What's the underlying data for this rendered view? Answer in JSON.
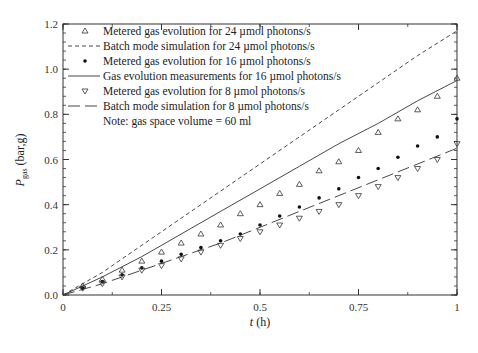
{
  "chart_data": {
    "type": "line",
    "title": "",
    "xlabel": "t (h)",
    "ylabel": "P_gas (bar,g)",
    "xlabel_parts": {
      "var": "t",
      "unit": " (h)"
    },
    "ylabel_parts": {
      "var": "P",
      "sub": "gas",
      "unit": " (bar,g)"
    },
    "xlim": [
      0,
      1
    ],
    "ylim": [
      0,
      1.2
    ],
    "x_ticks": [
      0,
      0.25,
      0.5,
      0.75,
      1
    ],
    "x_tick_labels": [
      "0",
      "0.25",
      "0.5",
      "0.75",
      "1"
    ],
    "y_ticks": [
      0.0,
      0.2,
      0.4,
      0.6,
      0.8,
      1.0,
      1.2
    ],
    "y_tick_labels": [
      "0.0",
      "0.2",
      "0.4",
      "0.6",
      "0.8",
      "1.0",
      "1.2"
    ],
    "grid": false,
    "legend_position": "upper left inside",
    "annotation": "Note: gas space volume = 60 ml",
    "series": [
      {
        "name": "Metered gas evolution for 24 µmol photons/s",
        "style": "marker-triangle-up",
        "x": [
          0.05,
          0.1,
          0.15,
          0.2,
          0.25,
          0.3,
          0.35,
          0.4,
          0.45,
          0.5,
          0.55,
          0.6,
          0.65,
          0.7,
          0.75,
          0.8,
          0.85,
          0.9,
          0.95,
          1.0
        ],
        "values": [
          0.04,
          0.07,
          0.11,
          0.15,
          0.19,
          0.23,
          0.27,
          0.31,
          0.36,
          0.4,
          0.45,
          0.49,
          0.55,
          0.59,
          0.64,
          0.72,
          0.78,
          0.82,
          0.88,
          0.96
        ]
      },
      {
        "name": "Batch mode simulation for 24 µmol photons/s",
        "style": "short-dash",
        "x": [
          0,
          0.1,
          0.2,
          0.3,
          0.4,
          0.5,
          0.6,
          0.7,
          0.8,
          0.9,
          1.0
        ],
        "values": [
          0,
          0.1,
          0.22,
          0.34,
          0.46,
          0.58,
          0.7,
          0.82,
          0.94,
          1.06,
          1.17
        ]
      },
      {
        "name": "Metered gas evolution for 16 µmol photons/s",
        "style": "marker-dot",
        "x": [
          0.05,
          0.1,
          0.15,
          0.2,
          0.25,
          0.3,
          0.35,
          0.4,
          0.45,
          0.5,
          0.55,
          0.6,
          0.65,
          0.7,
          0.75,
          0.8,
          0.85,
          0.9,
          0.95,
          1.0
        ],
        "values": [
          0.03,
          0.06,
          0.09,
          0.12,
          0.15,
          0.18,
          0.21,
          0.24,
          0.27,
          0.31,
          0.35,
          0.39,
          0.43,
          0.47,
          0.52,
          0.56,
          0.61,
          0.66,
          0.7,
          0.78
        ]
      },
      {
        "name": "Gas evolution measurements for 16 µmol photons/s",
        "style": "solid",
        "x": [
          0,
          0.1,
          0.2,
          0.3,
          0.4,
          0.5,
          0.6,
          0.7,
          0.8,
          0.9,
          1.0
        ],
        "values": [
          0,
          0.08,
          0.17,
          0.27,
          0.37,
          0.47,
          0.57,
          0.67,
          0.76,
          0.86,
          0.95
        ]
      },
      {
        "name": "Metered gas evolution for 8 µmol photons/s",
        "style": "marker-triangle-down",
        "x": [
          0.05,
          0.1,
          0.15,
          0.2,
          0.25,
          0.3,
          0.35,
          0.4,
          0.45,
          0.5,
          0.55,
          0.6,
          0.65,
          0.7,
          0.75,
          0.8,
          0.85,
          0.9,
          0.95,
          1.0
        ],
        "values": [
          0.03,
          0.05,
          0.08,
          0.11,
          0.13,
          0.16,
          0.19,
          0.22,
          0.25,
          0.28,
          0.31,
          0.34,
          0.37,
          0.4,
          0.44,
          0.48,
          0.52,
          0.56,
          0.6,
          0.67
        ]
      },
      {
        "name": "Batch mode simulation for 8 µmol photons/s",
        "style": "long-dash",
        "x": [
          0,
          0.1,
          0.2,
          0.3,
          0.4,
          0.5,
          0.6,
          0.7,
          0.8,
          0.9,
          1.0
        ],
        "values": [
          0,
          0.05,
          0.11,
          0.17,
          0.23,
          0.3,
          0.37,
          0.44,
          0.51,
          0.58,
          0.65
        ]
      }
    ]
  },
  "legend": {
    "items": [
      {
        "label": "Metered gas evolution for 24 µmol photons/s",
        "symbol": "triangle-up"
      },
      {
        "label": "Batch mode simulation for 24 µmol photons/s",
        "symbol": "short-dash"
      },
      {
        "label": "Metered gas evolution for 16 µmol photons/s",
        "symbol": "dot"
      },
      {
        "label": "Gas evolution measurements for 16 µmol photons/s",
        "symbol": "solid"
      },
      {
        "label": "Metered gas evolution for 8 µmol photons/s",
        "symbol": "triangle-down"
      },
      {
        "label": "Batch mode simulation for 8 µmol photons/s",
        "symbol": "long-dash"
      }
    ],
    "note": "Note: gas space volume = 60 ml"
  },
  "colors": {
    "axis": "#333333",
    "series": "#333333",
    "background": "#ffffff"
  }
}
